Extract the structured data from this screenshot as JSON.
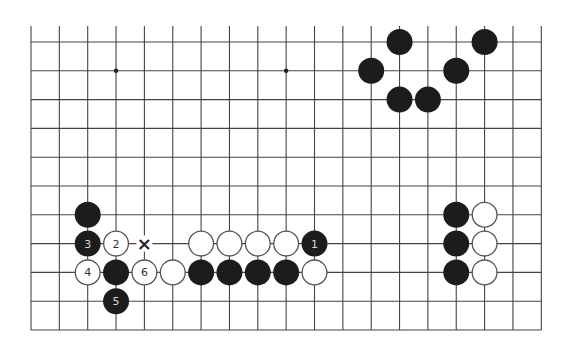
{
  "diagram": {
    "type": "go-board-partial",
    "columns": 19,
    "rows": 11,
    "origin_x": 31,
    "origin_y": 42,
    "spacing_x": 28.35,
    "spacing_y": 28.8,
    "top_edge_open": true,
    "top_extension": 16,
    "stone_radius": 13,
    "colors": {
      "line": "#444444",
      "black_stone": "#1c1c1c",
      "white_stone": "#ffffff",
      "white_stone_border": "#555555",
      "black_label": "#d8d8d8",
      "white_label": "#333333",
      "mark": "#222222"
    },
    "star_points": [
      {
        "col": 3,
        "row": 1
      },
      {
        "col": 9,
        "row": 1
      }
    ],
    "stones": [
      {
        "col": 13,
        "row": 0,
        "color": "black",
        "label": ""
      },
      {
        "col": 16,
        "row": 0,
        "color": "black",
        "label": ""
      },
      {
        "col": 12,
        "row": 1,
        "color": "black",
        "label": ""
      },
      {
        "col": 15,
        "row": 1,
        "color": "black",
        "label": ""
      },
      {
        "col": 13,
        "row": 2,
        "color": "black",
        "label": ""
      },
      {
        "col": 14,
        "row": 2,
        "color": "black",
        "label": ""
      },
      {
        "col": 2,
        "row": 6,
        "color": "black",
        "label": ""
      },
      {
        "col": 2,
        "row": 7,
        "color": "black",
        "label": "3"
      },
      {
        "col": 3,
        "row": 7,
        "color": "white",
        "label": "2"
      },
      {
        "col": 6,
        "row": 7,
        "color": "white",
        "label": ""
      },
      {
        "col": 7,
        "row": 7,
        "color": "white",
        "label": ""
      },
      {
        "col": 8,
        "row": 7,
        "color": "white",
        "label": ""
      },
      {
        "col": 9,
        "row": 7,
        "color": "white",
        "label": ""
      },
      {
        "col": 10,
        "row": 7,
        "color": "black",
        "label": "1"
      },
      {
        "col": 2,
        "row": 8,
        "color": "white",
        "label": "4"
      },
      {
        "col": 3,
        "row": 8,
        "color": "black",
        "label": ""
      },
      {
        "col": 4,
        "row": 8,
        "color": "white",
        "label": "6"
      },
      {
        "col": 5,
        "row": 8,
        "color": "white",
        "label": ""
      },
      {
        "col": 6,
        "row": 8,
        "color": "black",
        "label": ""
      },
      {
        "col": 7,
        "row": 8,
        "color": "black",
        "label": ""
      },
      {
        "col": 8,
        "row": 8,
        "color": "black",
        "label": ""
      },
      {
        "col": 9,
        "row": 8,
        "color": "black",
        "label": ""
      },
      {
        "col": 10,
        "row": 8,
        "color": "white",
        "label": ""
      },
      {
        "col": 3,
        "row": 9,
        "color": "black",
        "label": "5"
      },
      {
        "col": 15,
        "row": 6,
        "color": "black",
        "label": ""
      },
      {
        "col": 16,
        "row": 6,
        "color": "white",
        "label": ""
      },
      {
        "col": 15,
        "row": 7,
        "color": "black",
        "label": ""
      },
      {
        "col": 16,
        "row": 7,
        "color": "white",
        "label": ""
      },
      {
        "col": 15,
        "row": 8,
        "color": "black",
        "label": ""
      },
      {
        "col": 16,
        "row": 8,
        "color": "white",
        "label": ""
      }
    ],
    "marks": [
      {
        "col": 4,
        "row": 7,
        "symbol": "×",
        "name": "x-mark"
      }
    ]
  }
}
